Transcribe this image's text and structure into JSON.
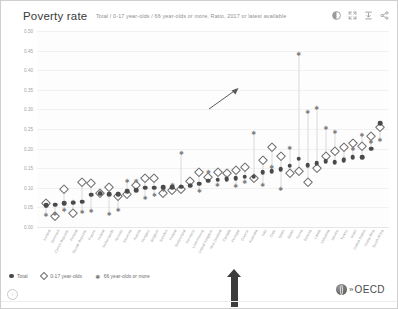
{
  "header": {
    "title": "Poverty rate",
    "subtitle": "Total / 0-17 year-olds / 66 year-olds or more, Ratio, 2017 or latest available",
    "toolbar": [
      {
        "name": "info-icon",
        "label": "Info"
      },
      {
        "name": "fullscreen-icon",
        "label": "Fullscreen"
      },
      {
        "name": "download-icon",
        "label": "Download"
      },
      {
        "name": "share-icon",
        "label": "Share"
      }
    ]
  },
  "legend": [
    {
      "name": "legend-total",
      "label": "Total",
      "marker": "filled-circle",
      "color": "#4a4a4a"
    },
    {
      "name": "legend-young",
      "label": "0-17 year-olds",
      "marker": "open-diamond",
      "color": "#6f6f6f"
    },
    {
      "name": "legend-old",
      "label": "66 year-olds or more",
      "marker": "asterisk",
      "color": "#808080"
    }
  ],
  "footer": {
    "mark": "i",
    "brand": "OECD",
    "chevrons": "»"
  },
  "annotations": {
    "callout_arrow": "diagonal-arrow-to-peak",
    "highlight_arrow": "up-arrow-highlight-korea"
  },
  "chart_data": {
    "type": "scatter",
    "title": "Poverty rate",
    "subtitle": "Total / 0-17 year-olds / 66 year-olds or more, Ratio, 2017 or latest available",
    "xlabel": "",
    "ylabel": "",
    "ylim": [
      0.0,
      0.5
    ],
    "yticks": [
      "0.50",
      "0.45",
      "0.40",
      "0.35",
      "0.30",
      "0.25",
      "0.20",
      "0.15",
      "0.10",
      "0.05",
      "0.00"
    ],
    "grid": true,
    "legend_position": "bottom-left",
    "sorted_by": "Total ascending",
    "categories": [
      "Iceland",
      "Denmark",
      "Czech Republic",
      "Finland",
      "Slovak Republic",
      "France",
      "Ireland",
      "Netherlands",
      "Norway",
      "Slovenia",
      "Austria",
      "Hungary",
      "Belgium",
      "Sweden",
      "Poland",
      "Switzerland",
      "Germany",
      "Luxembourg",
      "United Kingdom",
      "New Zealand",
      "Canada",
      "Portugal",
      "Greece",
      "Australia",
      "Italy",
      "Chile",
      "Spain",
      "Japan",
      "Korea",
      "Estonia",
      "Latvia",
      "Lithuania",
      "Mexico",
      "Turkey",
      "Israel",
      "United States",
      "Costa Rica",
      "South Africa"
    ],
    "series": [
      {
        "name": "Total",
        "marker": "filled-circle",
        "color": "#4a4a4a",
        "values": [
          0.055,
          0.057,
          0.06,
          0.062,
          0.065,
          0.082,
          0.085,
          0.083,
          0.084,
          0.092,
          0.094,
          0.1,
          0.1,
          0.101,
          0.102,
          0.103,
          0.105,
          0.11,
          0.118,
          0.121,
          0.122,
          0.125,
          0.128,
          0.128,
          0.14,
          0.143,
          0.148,
          0.156,
          0.174,
          0.157,
          0.163,
          0.168,
          0.166,
          0.17,
          0.178,
          0.178,
          0.2,
          0.265
        ]
      },
      {
        "name": "0-17 year-olds",
        "marker": "open-diamond",
        "color": "#6f6f6f",
        "values": [
          0.06,
          0.029,
          0.098,
          0.036,
          0.115,
          0.113,
          0.088,
          0.102,
          0.08,
          0.085,
          0.106,
          0.126,
          0.126,
          0.088,
          0.094,
          0.098,
          0.118,
          0.14,
          0.128,
          0.14,
          0.137,
          0.145,
          0.154,
          0.125,
          0.17,
          0.205,
          0.18,
          0.137,
          0.143,
          0.115,
          0.15,
          0.18,
          0.195,
          0.205,
          0.214,
          0.206,
          0.233,
          0.255
        ]
      },
      {
        "name": "66 year-olds or more",
        "marker": "asterisk",
        "color": "#808080",
        "values": [
          0.028,
          0.03,
          0.042,
          0.06,
          0.035,
          0.038,
          0.087,
          0.03,
          0.042,
          0.115,
          0.115,
          0.072,
          0.08,
          0.092,
          0.104,
          0.187,
          0.105,
          0.089,
          0.139,
          0.104,
          0.122,
          0.103,
          0.111,
          0.238,
          0.104,
          0.15,
          0.095,
          0.198,
          0.44,
          0.29,
          0.3,
          0.25,
          0.24,
          0.172,
          0.196,
          0.232,
          0.215,
          0.22
        ]
      }
    ],
    "highlighted_category": "Korea",
    "highlighted_value": 0.44
  }
}
